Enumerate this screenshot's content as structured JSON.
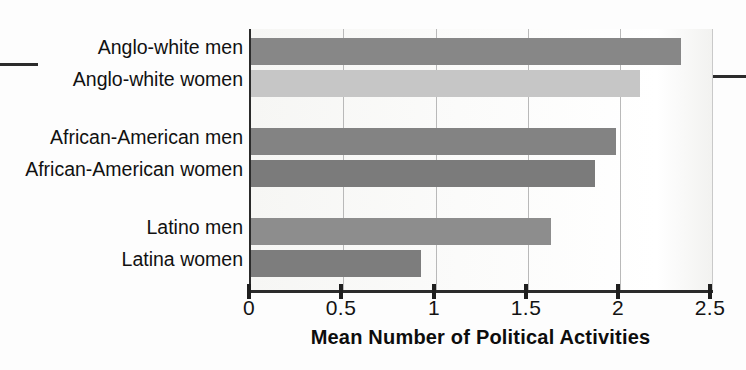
{
  "chart_data": {
    "type": "bar",
    "orientation": "horizontal",
    "title": "",
    "xlabel": "Mean Number of Political Activities",
    "ylabel": "",
    "xlim": [
      0,
      2.5
    ],
    "xticks": [
      "0",
      "0.5",
      "1",
      "1.5",
      "2",
      "2.5"
    ],
    "xtick_values": [
      0,
      0.5,
      1,
      1.5,
      2,
      2.5
    ],
    "grid": "vertical",
    "legend": "none",
    "categories": [
      "Anglo-white men",
      "Anglo-white women",
      "African-American men",
      "African-American women",
      "Latino men",
      "Latina women"
    ],
    "values": [
      2.32,
      2.1,
      1.97,
      1.86,
      1.62,
      0.92
    ],
    "bars": [
      {
        "label": "Anglo-white men",
        "value": 2.32,
        "color": "#878787"
      },
      {
        "label": "Anglo-white women",
        "value": 2.1,
        "color": "#c6c6c6"
      },
      {
        "label": "African-American men",
        "value": 1.97,
        "color": "#838383"
      },
      {
        "label": "African-American women",
        "value": 1.86,
        "color": "#7b7b7b"
      },
      {
        "label": "Latino men",
        "value": 1.62,
        "color": "#8d8d8d"
      },
      {
        "label": "Latina women",
        "value": 0.92,
        "color": "#7d7d7d"
      }
    ],
    "groups": [
      {
        "name": "Anglo-white",
        "categories": [
          "Anglo-white men",
          "Anglo-white women"
        ]
      },
      {
        "name": "African-American",
        "categories": [
          "African-American men",
          "African-American women"
        ]
      },
      {
        "name": "Latino",
        "categories": [
          "Latino men",
          "Latina women"
        ]
      }
    ]
  },
  "colors": {
    "axis": "#2b2b2b",
    "gridline": "#b9b9b9",
    "text": "#111111",
    "plot_background": "#fbfbfa"
  }
}
